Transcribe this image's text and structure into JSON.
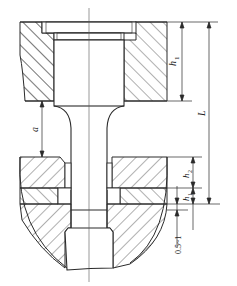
{
  "diagram": {
    "type": "engineering-cross-section",
    "colors": {
      "line": "#2a2a2a",
      "hatch": "#3a3a3a",
      "background": "#ffffff",
      "centerline": "#555555"
    },
    "labels": {
      "h1_top": "h",
      "h1_top_sub": "1",
      "L": "L",
      "a": "a",
      "h2": "h",
      "h2_sub": "2",
      "h1_bottom": "h",
      "h1_bottom_sub": "1",
      "gap": "0.5~1"
    },
    "dimensions": [
      {
        "name": "h1",
        "description": "depth of upper plate (counterbore height)"
      },
      {
        "name": "L",
        "description": "overall length from top face to lower plate interface"
      },
      {
        "name": "a",
        "description": "gap between upper plate bottom and lower plate top"
      },
      {
        "name": "h2",
        "description": "thickness of middle plate layer"
      },
      {
        "name": "h1",
        "description": "thickness of thin lower layer"
      },
      {
        "name": "0.5~1",
        "description": "clearance below lower layer"
      }
    ]
  }
}
